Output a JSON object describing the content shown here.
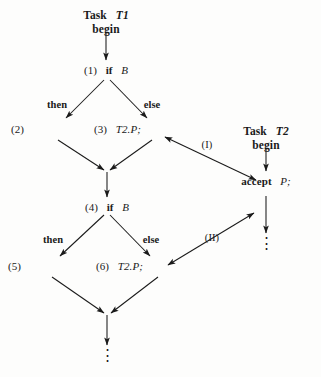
{
  "figure": {
    "background_color": "#fdfdfc",
    "ink_color": "#1a1a1a",
    "width": 321,
    "height": 377
  },
  "tasks": {
    "t1": {
      "header_keyword": "Task",
      "header_name": "T1",
      "begin_label": "begin",
      "tail_ellipsis": "⋮"
    },
    "t2": {
      "header_keyword": "Task",
      "header_name": "T2",
      "begin_label": "begin",
      "accept_keyword": "accept",
      "accept_entry": "P",
      "accept_semicolon": ";",
      "tail_ellipsis": "⋮"
    }
  },
  "nodes": {
    "n1": {
      "number": "(1)",
      "keyword": "if",
      "condition": "B"
    },
    "n2": {
      "number": "(2)"
    },
    "n3": {
      "number": "(3)",
      "call": "T2.P",
      "semicolon": ";"
    },
    "n4": {
      "number": "(4)",
      "keyword": "if",
      "condition": "B"
    },
    "n5": {
      "number": "(5)"
    },
    "n6": {
      "number": "(6)",
      "call": "T2.P",
      "semicolon": ";"
    }
  },
  "branch_labels": {
    "then_upper": "then",
    "else_upper": "else",
    "then_lower": "then",
    "else_lower": "else"
  },
  "rendezvous": {
    "first_label": "(I)",
    "second_label": "(II)"
  }
}
